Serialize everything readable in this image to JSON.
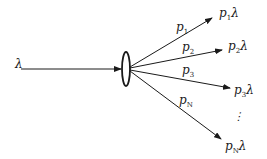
{
  "diagram": {
    "type": "probabilistic-splitting",
    "input": {
      "symbol": "λ",
      "label": "λ"
    },
    "splitter": {
      "shape": "ellipse"
    },
    "branches": [
      {
        "prob_base": "p",
        "prob_sub": "1",
        "out_base": "p",
        "out_sub": "1",
        "out_rate": "λ"
      },
      {
        "prob_base": "p",
        "prob_sub": "2",
        "out_base": "p",
        "out_sub": "2",
        "out_rate": "λ"
      },
      {
        "prob_base": "p",
        "prob_sub": "3",
        "out_base": "p",
        "out_sub": "3",
        "out_rate": "λ"
      },
      {
        "prob_base": "p",
        "prob_sub": "N",
        "out_base": "p",
        "out_sub": "N",
        "out_rate": "λ"
      }
    ],
    "ellipsis": "⋮",
    "colors": {
      "stroke": "#1a1a1a",
      "background": "#ffffff"
    }
  }
}
